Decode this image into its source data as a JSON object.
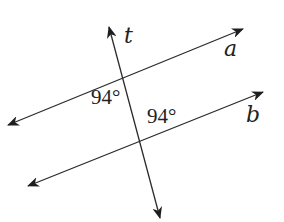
{
  "diagram": {
    "lines": [
      {
        "name": "a",
        "label": "a",
        "from": [
          8,
          125
        ],
        "to": [
          243,
          29
        ],
        "arrows": "both"
      },
      {
        "name": "b",
        "label": "b",
        "from": [
          28,
          186
        ],
        "to": [
          263,
          92
        ],
        "arrows": "both"
      },
      {
        "name": "t",
        "label": "t",
        "from": [
          160,
          218
        ],
        "to": [
          109,
          27
        ],
        "arrows": "both"
      }
    ],
    "labels": {
      "t": "t",
      "a": "a",
      "b": "b"
    },
    "angles": [
      {
        "id": "angle-at-a",
        "value": "94°",
        "position": "below line a, left of t"
      },
      {
        "id": "angle-at-b",
        "value": "94°",
        "position": "above line b, right of t"
      }
    ],
    "colors": {
      "line": "#2b2b2b",
      "text": "#222222",
      "background": "#ffffff"
    }
  }
}
